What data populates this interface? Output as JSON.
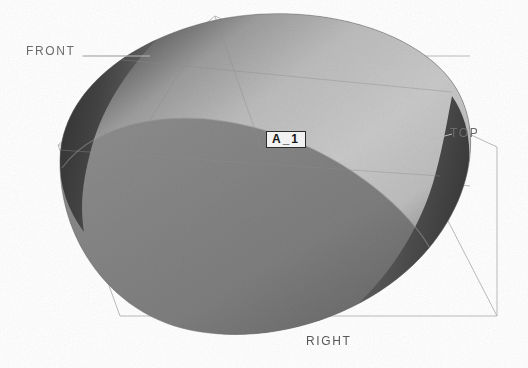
{
  "viewport": {
    "width": 528,
    "height": 368,
    "background_color": "#ffffff"
  },
  "orientation_labels": {
    "front": "FRONT",
    "top": "TOP",
    "right": "RIGHT"
  },
  "datum": {
    "label": "A_1"
  },
  "model": {
    "shape_name": "elliptical-solid",
    "surface_top_color": "#c9c9c9",
    "surface_body_color": "#808080",
    "surface_shadow_color": "#3f3f3f",
    "surface_mid_color": "#9a9a9a",
    "edge_color": "#707070"
  },
  "wireframe": {
    "line_color": "#b9b9b9",
    "apex_x": 215,
    "apex_y": 16,
    "left_x": 58,
    "left_y": 145,
    "right_x": 497,
    "right_y": 147,
    "bottom_y": 316
  }
}
